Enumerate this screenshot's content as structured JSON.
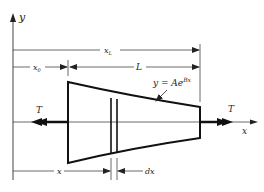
{
  "diagram": {
    "axes": {
      "x_label": "x",
      "y_label": "y"
    },
    "dimensions": {
      "x_L_label": "x",
      "x_L_sub": "L",
      "x_0_label": "x",
      "x_0_sub": "0",
      "L_label": "L",
      "x_label": "x",
      "dx_label": "dx"
    },
    "forces": {
      "left_label": "T",
      "right_label": "T"
    },
    "equation": {
      "lhs": "y = Ae",
      "exponent": "Bx"
    },
    "colors": {
      "line": "#222222",
      "background": "#ffffff"
    }
  }
}
